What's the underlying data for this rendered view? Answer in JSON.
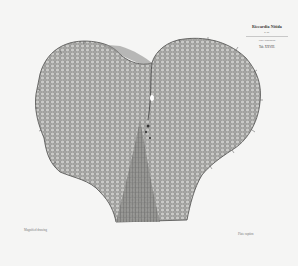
{
  "title_block": {
    "title": "Riccardia Nitida",
    "subtitle": "n. sp.",
    "note": "Plate illustration",
    "ref": "Tab. XXVIII."
  },
  "captions": {
    "left": "Magnified drawing",
    "right": "Plate caption"
  },
  "colors": {
    "paper": "#f5f5f4",
    "cell_fill": "#b9b9b7",
    "cell_line": "#5a5a58"
  }
}
